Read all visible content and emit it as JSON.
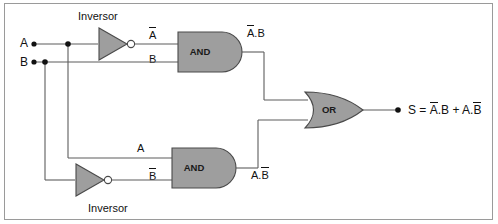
{
  "diagram": {
    "frame_color": "#9a9a9a",
    "gate_fill": "#9e9e9e",
    "gate_stroke": "#4a4a4a",
    "wire_color": "#5d5d5d"
  },
  "inputs": [
    {
      "label": "A",
      "x": 22,
      "y": 44
    },
    {
      "label": "B",
      "x": 22,
      "y": 62
    }
  ],
  "inverters": [
    {
      "caption": "Inversor",
      "position": "top",
      "caption_x": 78,
      "caption_y": 16
    },
    {
      "caption": "Inversor",
      "position": "bottom",
      "caption_x": 88,
      "caption_y": 203
    }
  ],
  "gates": [
    {
      "name": "and-gate-top",
      "label": "AND",
      "type": "and"
    },
    {
      "name": "and-gate-bottom",
      "label": "AND",
      "type": "and"
    },
    {
      "name": "or-gate",
      "label": "OR",
      "type": "or"
    }
  ],
  "wire_labels": {
    "top_and_input_1": {
      "text": "A",
      "overline": true
    },
    "top_and_input_2": {
      "text": "B",
      "overline": false
    },
    "top_and_output": {
      "pre": "A",
      "post": ".B",
      "overline_on": "A"
    },
    "bottom_and_input_1": {
      "text": "A",
      "overline": false
    },
    "bottom_and_input_2": {
      "text": "B",
      "overline": true
    },
    "bottom_and_output": {
      "pre": "A.",
      "post": "B",
      "overline_on": "B"
    }
  },
  "output": {
    "prefix": "S = ",
    "term1_head": "A",
    "term1_tail": ".B",
    "plus": " + ",
    "term2_head": "A.",
    "term2_tail": "B",
    "full_text": "S = A.B + A.B"
  }
}
